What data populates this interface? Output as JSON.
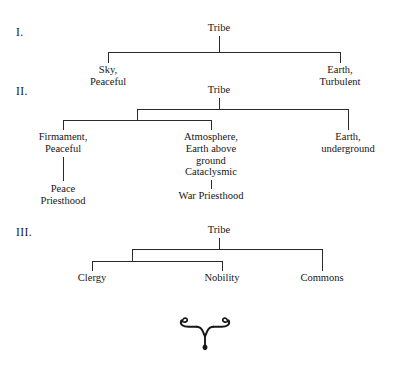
{
  "page": {
    "background_color": "#ffffff",
    "ink_color": "#161616",
    "rule_color": "#2a2a2a"
  },
  "sections": [
    {
      "numeral": "I.",
      "root": "Tribe",
      "children": [
        {
          "label": "Sky,\nPeaceful"
        },
        {
          "label": "Earth,\nTurbulent"
        }
      ]
    },
    {
      "numeral": "II.",
      "root": "Tribe",
      "children": [
        {
          "label": "Firmament,\nPeaceful",
          "sub": "Peace\nPriesthood"
        },
        {
          "label": "Atmosphere,\nEarth above\nground\nCataclysmic",
          "sub": "War Priesthood"
        },
        {
          "label": "Earth,\nunderground",
          "sub": ""
        }
      ]
    },
    {
      "numeral": "III.",
      "root": "Tribe",
      "children": [
        {
          "label": "Clergy"
        },
        {
          "label": "Nobility"
        },
        {
          "label": "Commons"
        }
      ]
    }
  ],
  "ornament": {
    "name": "fleuron-ornament",
    "description": "typographic fleuron divider"
  }
}
